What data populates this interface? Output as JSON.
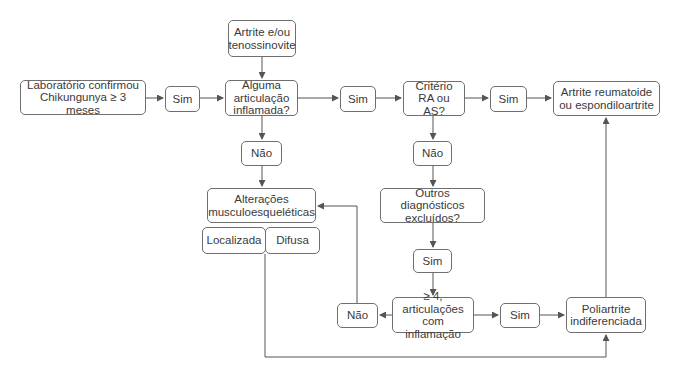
{
  "diagram": {
    "type": "flowchart",
    "language": "pt-BR",
    "nodes": {
      "entry": "Artrite e/ou\ntenossinovite",
      "lab": "Laboratório confirmou\nChikungunya ≥ 3 meses",
      "sim1": "Sim",
      "joint": "Alguma\narticulação\ninflamada?",
      "sim2": "Sim",
      "criteria": "Critério\nRA ou AS?",
      "sim3": "Sim",
      "ra": "Artrite reumatoide\nou espondiloartrite",
      "nao1": "Não",
      "nao2": "Não",
      "msk": "Alterações\nmusculoesqueléticas",
      "localized": "Localizada",
      "diffuse": "Difusa",
      "other": "Outros diagnósticos\nexcluídos?",
      "sim4": "Sim",
      "four": "≥ 4, articulações\ncom inflamação",
      "nao3": "Não",
      "sim5": "Sim",
      "poly": "Poliartrite\nindiferenciada"
    },
    "edges": [
      [
        "lab",
        "sim1"
      ],
      [
        "sim1",
        "joint"
      ],
      [
        "entry",
        "joint"
      ],
      [
        "joint",
        "sim2"
      ],
      [
        "sim2",
        "criteria"
      ],
      [
        "criteria",
        "sim3"
      ],
      [
        "sim3",
        "ra"
      ],
      [
        "joint",
        "nao1"
      ],
      [
        "nao1",
        "msk"
      ],
      [
        "criteria",
        "nao2"
      ],
      [
        "nao2",
        "other"
      ],
      [
        "other",
        "sim4"
      ],
      [
        "sim4",
        "four"
      ],
      [
        "four",
        "nao3"
      ],
      [
        "nao3",
        "msk"
      ],
      [
        "four",
        "sim5"
      ],
      [
        "sim5",
        "poly"
      ],
      [
        "poly",
        "ra"
      ],
      [
        "msk",
        "poly"
      ]
    ],
    "colors": {
      "line": "#555555",
      "border": "#6f6f6f",
      "text": "#3a3a3a",
      "background": "#ffffff"
    }
  }
}
